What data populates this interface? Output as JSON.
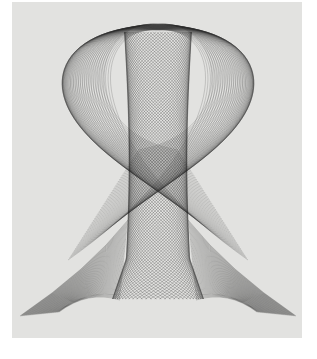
{
  "image": {
    "subject": "harmonograph line drawing",
    "palette": {
      "background": "#e2e2e0",
      "page": "#ffffff",
      "ink": "#1a1a1a"
    },
    "figure": {
      "center_x": 158,
      "top_y": 24,
      "bottom_y": 318,
      "outer_half_width": 140,
      "column_half_width": 34,
      "line_count": 60
    }
  }
}
